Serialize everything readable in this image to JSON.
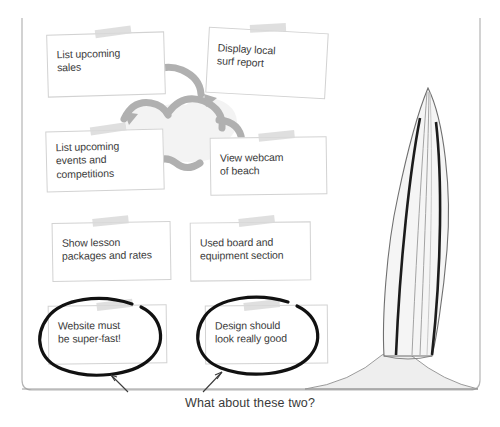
{
  "board": {
    "title": "Surf site requirements board",
    "frame_color": "#b5b5b5",
    "note_bg": "#ffffff",
    "note_border": "#d2d2d2",
    "tape_color": "#d9d9d9",
    "cloud_fill": "#f2f2f2",
    "cloud_stroke": "#a8a8a8",
    "circle_color": "#141414",
    "board_fill": "#f4f4f4",
    "board_stripe": "#1b1b1b",
    "sand_fill": "#ededed",
    "text_color": "#3b3b3b"
  },
  "notes": [
    {
      "id": "note-sales",
      "text": "List upcoming\nsales",
      "tape": "tape-strip",
      "circled": false
    },
    {
      "id": "note-surf",
      "text": "Display local\nsurf report",
      "tape": "tape-strip",
      "circled": false
    },
    {
      "id": "note-events",
      "text": "List upcoming\nevents and\ncompetitions",
      "tape": "tape-strip",
      "circled": false
    },
    {
      "id": "note-webcam",
      "text": "View webcam\nof beach",
      "tape": "tape-strip",
      "circled": false
    },
    {
      "id": "note-lesson",
      "text": "Show lesson\npackages and rates",
      "tape": "tape-strip",
      "circled": false
    },
    {
      "id": "note-used",
      "text": "Used board and\nequipment section",
      "tape": "tape-strip",
      "circled": false
    },
    {
      "id": "note-fast",
      "text": "Website must\nbe super-fast!",
      "tape": "tape-strip",
      "circled": true
    },
    {
      "id": "note-design",
      "text": "Design should\nlook really good",
      "tape": "tape-strip",
      "circled": true
    }
  ],
  "caption": {
    "text": "What about these two?",
    "arrow_count": 2
  },
  "artwork": {
    "cloud": "cloud-shape",
    "surfboard": "surfboard-shape",
    "sand": "sand-mound-shape",
    "ground_line": "horizontal-ground-line",
    "annotation_circles": [
      "ellipse-around-website-must-be-super-fast",
      "ellipse-around-design-should-look-really-good"
    ],
    "annotation_arrows": [
      "arrow-to-left-circled-note",
      "arrow-to-right-circled-note"
    ]
  }
}
